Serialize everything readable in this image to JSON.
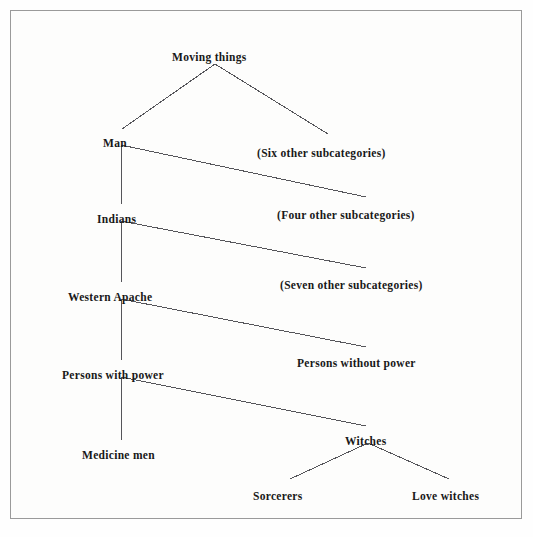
{
  "figure": {
    "kind": "hierarchical-taxonomy-tree",
    "border_color": "#9a9a9a",
    "background_color": "#fdfdfc",
    "line_color": "#55555a",
    "text_color": "#181818"
  },
  "nodes": [
    {
      "id": "moving-things",
      "label": "Moving things",
      "x": 172,
      "y": 52,
      "level": 0
    },
    {
      "id": "man",
      "label": "Man",
      "x": 103,
      "y": 138,
      "level": 1
    },
    {
      "id": "six-other",
      "label": "(Six other subcategories)",
      "x": 257,
      "y": 148,
      "level": 1
    },
    {
      "id": "indians",
      "label": "Indians",
      "x": 97,
      "y": 214,
      "level": 2
    },
    {
      "id": "four-other",
      "label": "(Four other subcategories)",
      "x": 277,
      "y": 210,
      "level": 2
    },
    {
      "id": "western-apache",
      "label": "Western Apache",
      "x": 68,
      "y": 292,
      "level": 3
    },
    {
      "id": "seven-other",
      "label": "(Seven other subcategories)",
      "x": 280,
      "y": 280,
      "level": 3
    },
    {
      "id": "persons-with-power",
      "label": "Persons with power",
      "x": 62,
      "y": 370,
      "level": 4
    },
    {
      "id": "persons-without-power",
      "label": "Persons without power",
      "x": 297,
      "y": 358,
      "level": 4
    },
    {
      "id": "medicine-men",
      "label": "Medicine men",
      "x": 82,
      "y": 450,
      "level": 5
    },
    {
      "id": "witches",
      "label": "Witches",
      "x": 345,
      "y": 436,
      "level": 5
    },
    {
      "id": "sorcerers",
      "label": "Sorcerers",
      "x": 253,
      "y": 491,
      "level": 6
    },
    {
      "id": "love-witches",
      "label": "Love witches",
      "x": 412,
      "y": 491,
      "level": 6
    }
  ],
  "edges": [
    {
      "from": "moving-things",
      "to": "man",
      "x1": 215,
      "y1": 64,
      "x2": 122,
      "y2": 129
    },
    {
      "from": "moving-things",
      "to": "six-other",
      "x1": 215,
      "y1": 64,
      "x2": 328,
      "y2": 134
    },
    {
      "from": "man",
      "to": "indians",
      "x1": 121,
      "y1": 145,
      "x2": 121,
      "y2": 204
    },
    {
      "from": "man",
      "to": "four-other",
      "x1": 121,
      "y1": 145,
      "x2": 366,
      "y2": 197
    },
    {
      "from": "indians",
      "to": "western-apache",
      "x1": 121,
      "y1": 221,
      "x2": 121,
      "y2": 282
    },
    {
      "from": "indians",
      "to": "seven-other",
      "x1": 121,
      "y1": 221,
      "x2": 366,
      "y2": 268
    },
    {
      "from": "western-apache",
      "to": "persons-with-power",
      "x1": 121,
      "y1": 299,
      "x2": 121,
      "y2": 360
    },
    {
      "from": "western-apache",
      "to": "persons-without-power",
      "x1": 121,
      "y1": 299,
      "x2": 366,
      "y2": 347
    },
    {
      "from": "persons-with-power",
      "to": "medicine-men",
      "x1": 121,
      "y1": 377,
      "x2": 121,
      "y2": 440
    },
    {
      "from": "persons-with-power",
      "to": "witches",
      "x1": 121,
      "y1": 377,
      "x2": 366,
      "y2": 426
    },
    {
      "from": "witches",
      "to": "sorcerers",
      "x1": 368,
      "y1": 443,
      "x2": 290,
      "y2": 479
    },
    {
      "from": "witches",
      "to": "love-witches",
      "x1": 368,
      "y1": 443,
      "x2": 449,
      "y2": 479
    }
  ]
}
